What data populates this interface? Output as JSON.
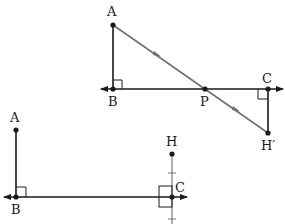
{
  "colors": {
    "line": "#1a1a1a",
    "reflection_ray": "#707070",
    "tick": "#7a7a7a",
    "background": "#ffffff"
  },
  "top_figure": {
    "labels": {
      "A": "A",
      "B": "B",
      "P": "P",
      "C": "C",
      "H_prime": "H′"
    },
    "points": {
      "A": [
        113,
        25
      ],
      "B": [
        113,
        89
      ],
      "P": [
        205,
        89
      ],
      "C": [
        268,
        89
      ],
      "H_prime": [
        268,
        133
      ]
    },
    "right_angles": [
      "B",
      "C"
    ],
    "ray_arrows": 2
  },
  "bottom_figure": {
    "labels": {
      "A": "A",
      "B": "B",
      "C": "C",
      "H": "H"
    },
    "points": {
      "A": [
        16,
        130
      ],
      "B": [
        16,
        197
      ],
      "C": [
        172,
        197
      ],
      "H": [
        172,
        154
      ]
    },
    "right_angles": [
      "B",
      "C"
    ],
    "tick_marks": 2
  }
}
